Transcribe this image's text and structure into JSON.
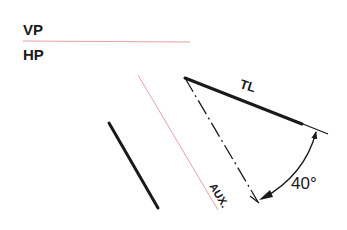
{
  "diagram": {
    "type": "orthographic-projection-auxiliary-view",
    "labels": {
      "vp": "VP",
      "hp": "HP",
      "true_length": "TL",
      "angle": "40°",
      "auxiliary": "AUX."
    },
    "colors": {
      "ink": "#1a1a1a",
      "reference_line": "#e8a0a8",
      "background": "#ffffff"
    },
    "angle_degrees": 40
  }
}
